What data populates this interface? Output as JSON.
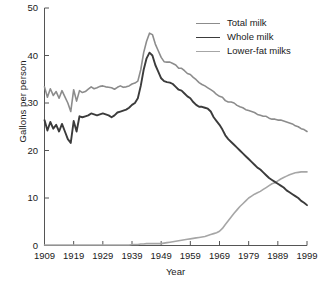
{
  "chart_data": {
    "type": "line",
    "title": "",
    "xlabel": "Year",
    "ylabel": "Gallons per person",
    "xlim": [
      1909,
      1999
    ],
    "ylim": [
      0,
      50
    ],
    "xticks": [
      "1909",
      "1919",
      "1929",
      "1939",
      "1949",
      "1959",
      "1969",
      "1979",
      "1989",
      "1999"
    ],
    "yticks": [
      "0",
      "10",
      "20",
      "30",
      "40",
      "50"
    ],
    "grid": false,
    "legend_position": "top-right",
    "x": [
      1909,
      1910,
      1911,
      1912,
      1913,
      1914,
      1915,
      1916,
      1917,
      1918,
      1919,
      1920,
      1921,
      1922,
      1923,
      1924,
      1925,
      1926,
      1927,
      1928,
      1929,
      1930,
      1931,
      1932,
      1933,
      1934,
      1935,
      1936,
      1937,
      1938,
      1939,
      1940,
      1941,
      1942,
      1943,
      1944,
      1945,
      1946,
      1947,
      1948,
      1949,
      1950,
      1951,
      1952,
      1953,
      1954,
      1955,
      1956,
      1957,
      1958,
      1959,
      1960,
      1961,
      1962,
      1963,
      1964,
      1965,
      1966,
      1967,
      1968,
      1969,
      1970,
      1971,
      1972,
      1973,
      1974,
      1975,
      1976,
      1977,
      1978,
      1979,
      1980,
      1981,
      1982,
      1983,
      1984,
      1985,
      1986,
      1987,
      1988,
      1989,
      1990,
      1991,
      1992,
      1993,
      1994,
      1995,
      1996,
      1997,
      1998,
      1999
    ],
    "series": [
      {
        "name": "Total milk",
        "color": "#8c8c8c",
        "line_width": 1.6,
        "values": [
          33.4,
          31.2,
          33.0,
          31.6,
          32.4,
          31.0,
          32.6,
          31.3,
          30.0,
          28.2,
          32.8,
          30.4,
          32.6,
          32.2,
          32.4,
          32.9,
          33.4,
          33.0,
          33.2,
          33.5,
          33.6,
          33.4,
          33.3,
          33.2,
          32.9,
          33.3,
          33.6,
          33.3,
          33.4,
          33.6,
          34.0,
          34.2,
          34.6,
          37.0,
          40.6,
          43.0,
          44.7,
          44.4,
          42.4,
          41.0,
          39.6,
          38.7,
          38.6,
          38.6,
          38.3,
          38.0,
          37.3,
          37.3,
          36.8,
          36.2,
          36.0,
          35.4,
          34.9,
          34.3,
          33.9,
          33.6,
          33.2,
          32.8,
          32.4,
          31.8,
          31.4,
          31.2,
          30.5,
          30.2,
          30.2,
          30.0,
          29.5,
          29.2,
          29.0,
          28.6,
          28.4,
          28.2,
          28.0,
          27.6,
          27.4,
          27.2,
          27.2,
          26.8,
          26.6,
          26.6,
          26.4,
          26.4,
          26.2,
          26.0,
          25.8,
          25.6,
          25.2,
          25.0,
          24.6,
          24.4,
          24.0
        ]
      },
      {
        "name": "Whole milk",
        "color": "#3b3b3b",
        "line_width": 1.9,
        "values": [
          26.4,
          24.2,
          26.0,
          24.6,
          25.4,
          24.0,
          25.6,
          24.0,
          22.4,
          21.6,
          26.2,
          24.0,
          27.2,
          27.0,
          27.2,
          27.4,
          27.8,
          27.6,
          27.4,
          27.6,
          27.8,
          27.6,
          27.4,
          27.0,
          27.4,
          28.0,
          28.2,
          28.4,
          28.6,
          29.0,
          29.6,
          30.0,
          31.0,
          33.6,
          37.0,
          39.4,
          40.6,
          40.0,
          38.0,
          36.6,
          35.2,
          34.6,
          34.4,
          34.3,
          34.0,
          33.4,
          32.8,
          32.6,
          32.0,
          31.4,
          31.0,
          30.2,
          29.6,
          29.2,
          29.2,
          29.0,
          28.8,
          28.2,
          27.0,
          26.2,
          25.4,
          24.4,
          23.2,
          22.4,
          21.8,
          21.2,
          20.6,
          20.0,
          19.4,
          18.8,
          18.2,
          17.6,
          17.0,
          16.4,
          16.0,
          15.4,
          14.8,
          14.2,
          13.8,
          13.4,
          13.0,
          12.6,
          12.2,
          11.6,
          11.2,
          10.8,
          10.4,
          10.0,
          9.4,
          9.0,
          8.5
        ]
      },
      {
        "name": "Lower-fat milks",
        "color": "#a6a6a6",
        "line_width": 1.6,
        "values": [
          0.1,
          0.1,
          0.1,
          0.1,
          0.1,
          0.1,
          0.1,
          0.1,
          0.1,
          0.1,
          0.1,
          0.1,
          0.1,
          0.1,
          0.1,
          0.1,
          0.1,
          0.1,
          0.1,
          0.1,
          0.1,
          0.1,
          0.1,
          0.1,
          0.1,
          0.1,
          0.1,
          0.1,
          0.1,
          0.1,
          0.2,
          0.2,
          0.2,
          0.3,
          0.3,
          0.4,
          0.4,
          0.4,
          0.4,
          0.4,
          0.4,
          0.5,
          0.6,
          0.7,
          0.8,
          0.9,
          1.0,
          1.1,
          1.2,
          1.3,
          1.4,
          1.5,
          1.6,
          1.7,
          1.8,
          1.9,
          2.1,
          2.3,
          2.5,
          2.7,
          3.0,
          3.6,
          4.4,
          5.2,
          6.0,
          6.8,
          7.5,
          8.2,
          8.8,
          9.4,
          10.0,
          10.4,
          10.8,
          11.1,
          11.4,
          11.8,
          12.2,
          12.6,
          13.0,
          13.2,
          13.6,
          14.0,
          14.3,
          14.6,
          14.9,
          15.1,
          15.3,
          15.4,
          15.5,
          15.5,
          15.5
        ]
      }
    ]
  },
  "legend": {
    "items": [
      {
        "label": "Total milk"
      },
      {
        "label": "Whole milk"
      },
      {
        "label": "Lower-fat milks"
      }
    ]
  },
  "axes": {
    "x_title": "Year",
    "y_title": "Gallons per person"
  }
}
